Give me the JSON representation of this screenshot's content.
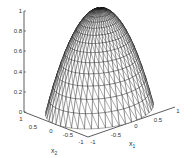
{
  "chart_data": {
    "type": "surface-mesh",
    "title": "",
    "xlabel": "x1",
    "ylabel": "x2",
    "zlabel": "",
    "xlim": [
      -1,
      1
    ],
    "ylim": [
      -1,
      1
    ],
    "zlim": [
      0,
      1
    ],
    "z_ticks": [
      "0",
      "0.2",
      "0.4",
      "0.6",
      "0.8",
      "1"
    ],
    "x1_ticks": [
      "-1",
      "-0.5",
      "0",
      "0.5",
      "1"
    ],
    "x2_ticks": [
      "1",
      "0.5",
      "0",
      "-0.5",
      "-1"
    ],
    "surface": "z = 1 - x1^2 - x2^2 over unit disk (paraboloid cap)",
    "peak": {
      "x1": 0,
      "x2": 0,
      "z": 1
    },
    "grid": false,
    "mesh_color": "#000000",
    "background": "#ffffff"
  },
  "axes": {
    "z_ticks": [
      "0",
      "0.2",
      "0.4",
      "0.6",
      "0.8",
      "1"
    ],
    "x2_ticks": [
      "1",
      "0.5",
      "0",
      "-0.5",
      "-1"
    ],
    "x1_ticks": [
      "-1",
      "-0.5",
      "0",
      "0.5",
      "1"
    ],
    "x2_label": "x",
    "x2_sub": "2",
    "x1_label": "x",
    "x1_sub": "1"
  }
}
